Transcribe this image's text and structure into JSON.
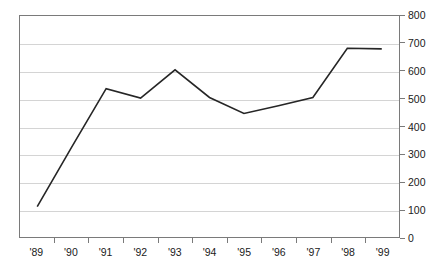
{
  "chart_data": {
    "type": "line",
    "title": "",
    "subtitle": "",
    "xlabel": "",
    "ylabel": "",
    "categories": [
      "'89",
      "'90",
      "'91",
      "'92",
      "'93",
      "'94",
      "'95",
      "'96",
      "'97",
      "'98",
      "'99"
    ],
    "series": [
      {
        "name": "",
        "values": [
          110,
          325,
          537,
          503,
          605,
          505,
          447,
          475,
          505,
          683,
          681
        ]
      }
    ],
    "ylim": [
      0,
      800
    ],
    "ytick_values": [
      0,
      100,
      200,
      300,
      400,
      500,
      600,
      700,
      800
    ],
    "ytick_labels": [
      "0",
      "100",
      "200",
      "300",
      "400",
      "500",
      "600",
      "700",
      "800"
    ],
    "xtick_labels": [
      "'89",
      "'90",
      "'91",
      "'92",
      "'93",
      "'94",
      "'95",
      "'96",
      "'97",
      "'98",
      "'99"
    ],
    "grid": true,
    "grid_axis": "y",
    "legend": false,
    "legend_position": "none",
    "y_axis_position": "right",
    "annotations": []
  },
  "style": {
    "line_color": "#262626",
    "grid_color": "#d4d4d4",
    "axis_color": "#7a7a7a",
    "background_color": "#ffffff",
    "text_color": "#1a1a1a"
  }
}
